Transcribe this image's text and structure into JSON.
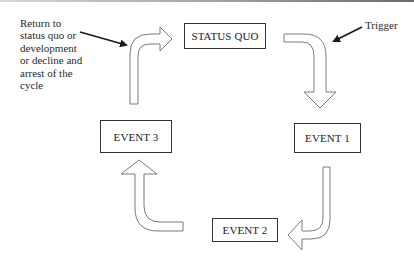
{
  "diagram": {
    "type": "cycle",
    "nodes": [
      {
        "id": "status_quo",
        "label": "STATUS QUO"
      },
      {
        "id": "event_1",
        "label": "EVENT 1"
      },
      {
        "id": "event_2",
        "label": "EVENT 2"
      },
      {
        "id": "event_3",
        "label": "EVENT 3"
      }
    ],
    "edges": [
      {
        "from": "status_quo",
        "to": "event_1",
        "style": "curved-block-arrow"
      },
      {
        "from": "event_1",
        "to": "event_2",
        "style": "curved-block-arrow"
      },
      {
        "from": "event_2",
        "to": "event_3",
        "style": "curved-block-arrow"
      },
      {
        "from": "event_3",
        "to": "status_quo",
        "style": "curved-block-arrow"
      }
    ],
    "annotations": {
      "left_note_lines": [
        "Return to",
        "status quo or",
        "development",
        "or decline and",
        "arrest of the",
        "cycle"
      ],
      "trigger": "Trigger"
    },
    "colors": {
      "stroke": "#333333",
      "arrow_outline": "#7a7a7a",
      "background": "#ffffff"
    }
  }
}
